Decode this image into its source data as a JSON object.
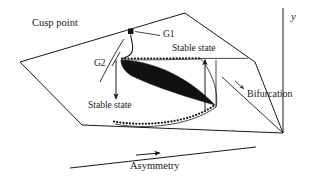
{
  "figure": {
    "type": "diagram",
    "background_color": "#ffffff",
    "stroke_color": "#1a1a1a",
    "fill_color": "#111111"
  },
  "labels": {
    "cusp_point": "Cusp point",
    "g1": "G1",
    "g2": "G2",
    "stable_state_upper": "Stable state",
    "stable_state_lower": "Stable state",
    "bifurcation": "Bifurcation",
    "asymmetry": "Asymmetry",
    "y_axis": "y"
  },
  "icons": {
    "cusp_marker": "filled-square-marker",
    "arrow_up": "arrow-up-icon",
    "arrow_down": "arrow-down-icon",
    "arrow_right": "arrow-right-icon",
    "arrow_diagonal": "arrow-diagonal-icon"
  },
  "geometry": {
    "plane_vertices": "20,62 185,13 255,62 283,133 82,125",
    "cusp_region": "crescent wedge, tip at right",
    "dotted_curve_upper": "horizontal dotted line y=59 from x=122 to x=200",
    "dotted_curve_lower": "rising dotted curve from x=115,y=122 to x=215,y=106",
    "y_axis_line": "vertical line at x=283 from y=8 to y=133",
    "asymmetry_axis": "slanted line from x=70,y=168 to x=255,y=148"
  }
}
